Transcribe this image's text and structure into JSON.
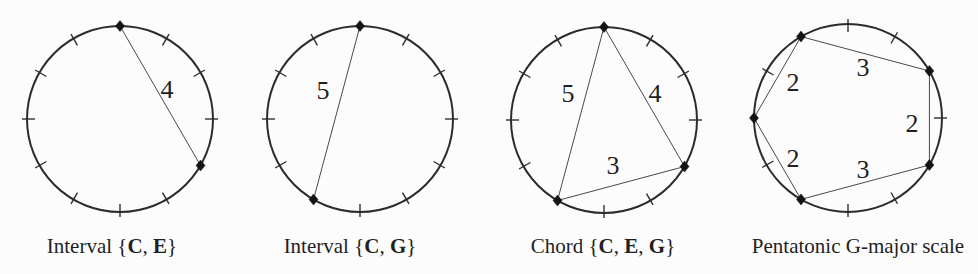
{
  "figure": {
    "background": "#fcfcfc",
    "ink": "#1f1f1f",
    "stroke_color": "#2b2b2b",
    "chord_color": "#4a4a4a",
    "modulus": 12,
    "diagrams": [
      {
        "id": "interval-c-e",
        "caption_text": "Interval {C, E}",
        "caption_parts": [
          {
            "text": "Interval {",
            "bold": false
          },
          {
            "text": "C",
            "bold": true
          },
          {
            "text": ", ",
            "bold": false
          },
          {
            "text": "E",
            "bold": true
          },
          {
            "text": "}",
            "bold": false
          }
        ],
        "caption_x": 112,
        "center": [
          120,
          119
        ],
        "radius": 93,
        "marked_positions": [
          0,
          4
        ],
        "edges": [
          {
            "from": 0,
            "to": 4,
            "label": "4",
            "label_offset": [
              47,
              -30
            ]
          }
        ]
      },
      {
        "id": "interval-c-g",
        "caption_text": "Interval {C, G}",
        "caption_parts": [
          {
            "text": "Interval {",
            "bold": false
          },
          {
            "text": "C",
            "bold": true
          },
          {
            "text": ", ",
            "bold": false
          },
          {
            "text": "G",
            "bold": true
          },
          {
            "text": "}",
            "bold": false
          }
        ],
        "caption_x": 350,
        "center": [
          360,
          119
        ],
        "radius": 93,
        "marked_positions": [
          0,
          7
        ],
        "edges": [
          {
            "from": 0,
            "to": 7,
            "label": "5",
            "label_offset": [
              -37,
              -29
            ]
          }
        ]
      },
      {
        "id": "chord-c-e-g",
        "caption_text": "Chord {C, E, G}",
        "caption_parts": [
          {
            "text": "Chord {",
            "bold": false
          },
          {
            "text": "C",
            "bold": true
          },
          {
            "text": ", ",
            "bold": false
          },
          {
            "text": "E",
            "bold": true
          },
          {
            "text": ", ",
            "bold": false
          },
          {
            "text": "G",
            "bold": true
          },
          {
            "text": "}",
            "bold": false
          }
        ],
        "caption_x": 603,
        "center": [
          604,
          120
        ],
        "radius": 93,
        "marked_positions": [
          0,
          4,
          7
        ],
        "edges": [
          {
            "from": 0,
            "to": 7,
            "label": "5",
            "label_offset": [
              -36,
              -27
            ]
          },
          {
            "from": 0,
            "to": 4,
            "label": "4",
            "label_offset": [
              51,
              -27
            ]
          },
          {
            "from": 4,
            "to": 7,
            "label": "3",
            "label_offset": [
              9,
              45
            ]
          }
        ]
      },
      {
        "id": "pentatonic-g-major",
        "caption_text": "Pentatonic G-major scale",
        "caption_parts": [
          {
            "text": "Pentatonic G-major scale",
            "bold": false
          }
        ],
        "caption_x": 858,
        "center": [
          848,
          118
        ],
        "radius": 94,
        "marked_positions": [
          11,
          2,
          4,
          7,
          9
        ],
        "edges": [
          {
            "from": 9,
            "to": 11,
            "label": "2",
            "label_offset": [
              -55,
              -36
            ]
          },
          {
            "from": 11,
            "to": 2,
            "label": "3",
            "label_offset": [
              15,
              -51
            ]
          },
          {
            "from": 2,
            "to": 4,
            "label": "2",
            "label_offset": [
              64,
              5
            ]
          },
          {
            "from": 4,
            "to": 7,
            "label": "3",
            "label_offset": [
              15,
              51
            ]
          },
          {
            "from": 7,
            "to": 9,
            "label": "2",
            "label_offset": [
              -55,
              40
            ]
          }
        ]
      }
    ]
  }
}
